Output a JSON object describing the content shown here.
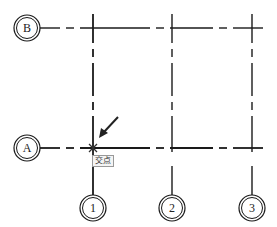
{
  "axes": {
    "horizontal": [
      {
        "label": "B",
        "y": 28
      },
      {
        "label": "A",
        "y": 148
      }
    ],
    "vertical": [
      {
        "label": "1",
        "x": 93
      },
      {
        "label": "2",
        "x": 172
      },
      {
        "label": "3",
        "x": 252
      }
    ]
  },
  "snap": {
    "tooltip": "交点",
    "x": 93,
    "y": 148
  },
  "colors": {
    "line": "#1a1a1a",
    "background": "#ffffff"
  }
}
